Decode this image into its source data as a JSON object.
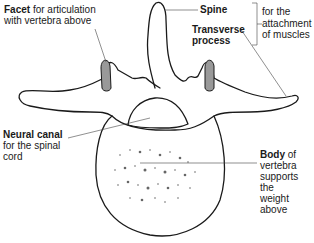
{
  "diagram": {
    "labels": {
      "facet": {
        "bold": "Facet",
        "text1": " for articulation",
        "text2": "with vertebra above"
      },
      "spine": {
        "bold": "Spine"
      },
      "transverse": {
        "bold1": "Transverse",
        "bold2": "process"
      },
      "muscles": {
        "line1": "for the",
        "line2": "attachment",
        "line3": "of muscles"
      },
      "neural": {
        "bold": "Neural canal",
        "line2": "for the spinal",
        "line3": "cord"
      },
      "body": {
        "bold": "Body",
        "text1": " of",
        "line2": "vertebra",
        "line3": "supports",
        "line4": "the",
        "line5": "weight",
        "line6": "above"
      }
    },
    "colors": {
      "outline": "#1a1a1a",
      "facet_fill": "#999999",
      "background": "#ffffff"
    }
  }
}
